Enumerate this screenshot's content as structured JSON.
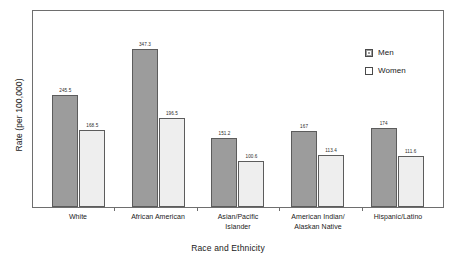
{
  "chart_data": {
    "type": "bar",
    "title": "",
    "xlabel": "Race and Ethnicity",
    "ylabel": "Rate (per 100,000)",
    "ylim": [
      0,
      400
    ],
    "grid": false,
    "legend_position": "top-right",
    "categories": [
      "White",
      "African American",
      "Asian/Pacific Islander",
      "American Indian/ Alaskan Native",
      "Hispanic/Latino"
    ],
    "category_lines": [
      [
        "White"
      ],
      [
        "African American"
      ],
      [
        "Asian/Pacific",
        "Islander"
      ],
      [
        "American Indian/",
        "Alaskan Native"
      ],
      [
        "Hispanic/Latino"
      ]
    ],
    "series": [
      {
        "name": "Men",
        "color": "#9c9c9c",
        "values": [
          245.5,
          347.3,
          151.2,
          167,
          174
        ],
        "labels": [
          "245.5",
          "347.3",
          "151.2",
          "167",
          "174"
        ]
      },
      {
        "name": "Women",
        "color": "#eeeeee",
        "values": [
          168.5,
          196.5,
          100.6,
          113.4,
          111.6
        ],
        "labels": [
          "168.5",
          "196.5",
          "100.6",
          "113.4",
          "111.6"
        ]
      }
    ]
  },
  "legend": {
    "items": [
      {
        "label": "Men"
      },
      {
        "label": "Women"
      }
    ]
  },
  "axes": {
    "x_title": "Race and Ethnicity",
    "y_title": "Rate (per 100,000)"
  },
  "colors": {
    "men_fill": "#9c9c9c",
    "women_fill": "#eeeeee",
    "border": "#5c5c5c",
    "frame": "#6e6e6e",
    "text": "#1a1a1a",
    "background": "#ffffff"
  }
}
